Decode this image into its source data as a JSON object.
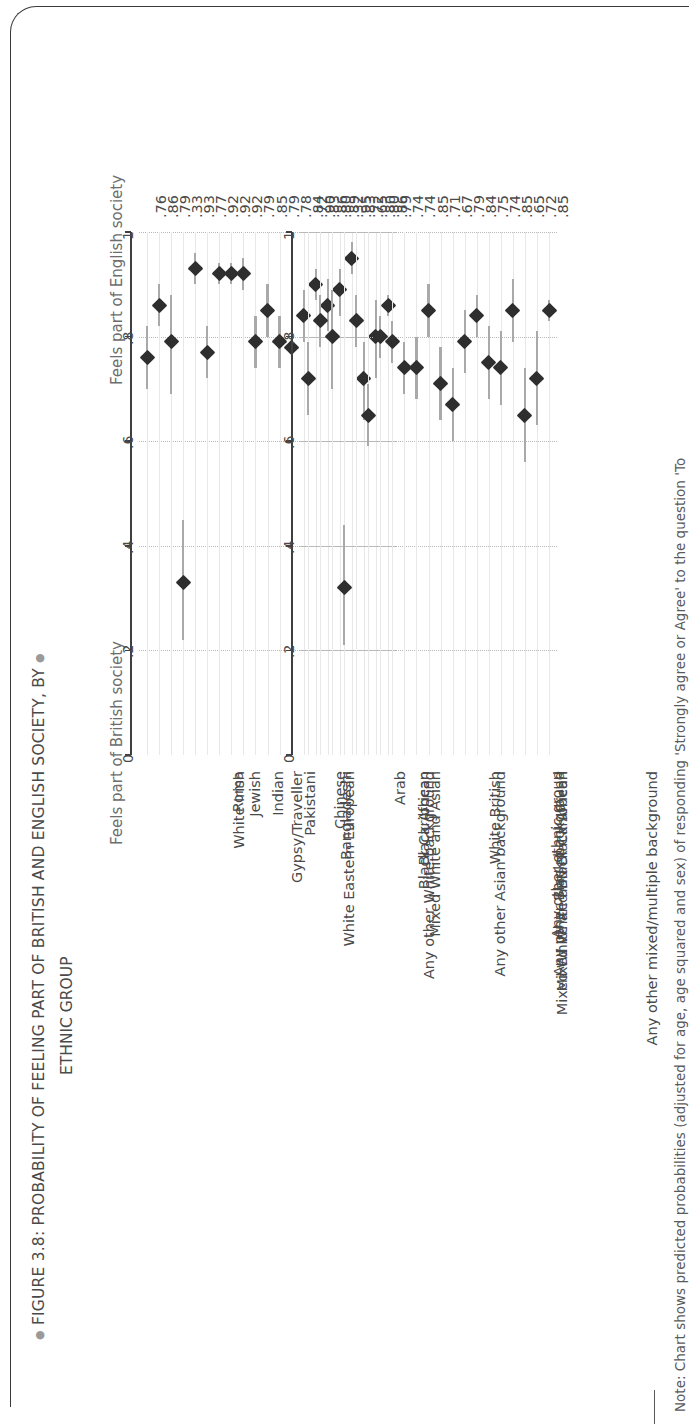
{
  "figure": {
    "title": "FIGURE 3.8: PROBABILITY OF FEELING PART OF BRITISH AND ENGLISH SOCIETY, BY",
    "subtitle": "ETHNIC GROUP",
    "note": "Note: Chart shows predicted probabilities (adjusted for age, age squared and sex) of responding 'Strongly agree or Agree' to the question 'To"
  },
  "axis": {
    "ticks": [
      "0",
      ".2",
      ".4",
      ".6",
      ".8",
      "1"
    ],
    "tick_values": [
      0,
      0.2,
      0.4,
      0.6,
      0.8,
      1
    ]
  },
  "chart_data": {
    "type": "scatter",
    "xlabel": "",
    "ylabel": "",
    "xlim": [
      0,
      1
    ],
    "grid": true,
    "legend": "none",
    "orientation": "horizontal-dot-whisker",
    "categories": [
      "White Irish",
      "White Eastern European",
      "Gypsy/Traveller",
      "Roma",
      "Jewish",
      "Any other White background",
      "Indian",
      "Pakistani",
      "Bangladeshi",
      "Mixed White and Asian",
      "Chinese",
      "Any other Asian background",
      "Black Caribbean",
      "Mixed White and Black Caribbean",
      "Black African",
      "Mixed White and Black African",
      "Any other Black background",
      "Arab",
      "Any other mixed/multiple background",
      "Any other ethnic group",
      "White British"
    ],
    "panels": [
      {
        "name": "british",
        "caption": "Feels part of British society",
        "values": [
          0.76,
          0.86,
          0.79,
          0.33,
          0.93,
          0.77,
          0.92,
          0.92,
          0.92,
          0.79,
          0.85,
          0.79,
          0.78,
          0.84,
          0.9,
          0.86,
          0.89,
          0.95,
          0.72,
          0.8,
          0.86
        ],
        "labels": [
          ".76",
          ".86",
          ".79",
          ".33",
          ".93",
          ".77",
          ".92",
          ".92",
          ".92",
          ".79",
          ".85",
          ".79",
          ".78",
          ".84",
          ".90",
          ".86",
          ".89",
          ".95",
          ".72",
          ".80",
          ".86"
        ],
        "ci_low": [
          0.7,
          0.82,
          0.69,
          0.22,
          0.9,
          0.72,
          0.9,
          0.9,
          0.89,
          0.74,
          0.8,
          0.74,
          0.72,
          0.79,
          0.87,
          0.81,
          0.84,
          0.92,
          0.64,
          0.72,
          0.84
        ],
        "ci_high": [
          0.82,
          0.9,
          0.88,
          0.45,
          0.96,
          0.82,
          0.94,
          0.94,
          0.95,
          0.84,
          0.9,
          0.84,
          0.84,
          0.89,
          0.93,
          0.91,
          0.93,
          0.98,
          0.79,
          0.87,
          0.88
        ]
      },
      {
        "name": "english",
        "caption": "Feels part of English society",
        "values": [
          0.72,
          0.83,
          0.8,
          0.32,
          0.83,
          0.65,
          0.8,
          0.79,
          0.74,
          0.74,
          0.85,
          0.71,
          0.67,
          0.79,
          0.84,
          0.75,
          0.74,
          0.85,
          0.65,
          0.72,
          0.85
        ],
        "labels": [
          ".72",
          ".83",
          ".80",
          ".32",
          ".83",
          ".65",
          ".80",
          ".79",
          ".74",
          ".74",
          ".85",
          ".71",
          ".67",
          ".79",
          ".84",
          ".75",
          ".74",
          ".85",
          ".65",
          ".72",
          ".85"
        ],
        "ci_low": [
          0.65,
          0.78,
          0.7,
          0.21,
          0.78,
          0.59,
          0.76,
          0.75,
          0.69,
          0.68,
          0.8,
          0.64,
          0.6,
          0.73,
          0.8,
          0.68,
          0.67,
          0.79,
          0.56,
          0.63,
          0.83
        ],
        "ci_high": [
          0.79,
          0.88,
          0.89,
          0.44,
          0.88,
          0.71,
          0.84,
          0.83,
          0.79,
          0.8,
          0.9,
          0.78,
          0.74,
          0.85,
          0.88,
          0.82,
          0.81,
          0.91,
          0.74,
          0.81,
          0.87
        ]
      }
    ]
  }
}
